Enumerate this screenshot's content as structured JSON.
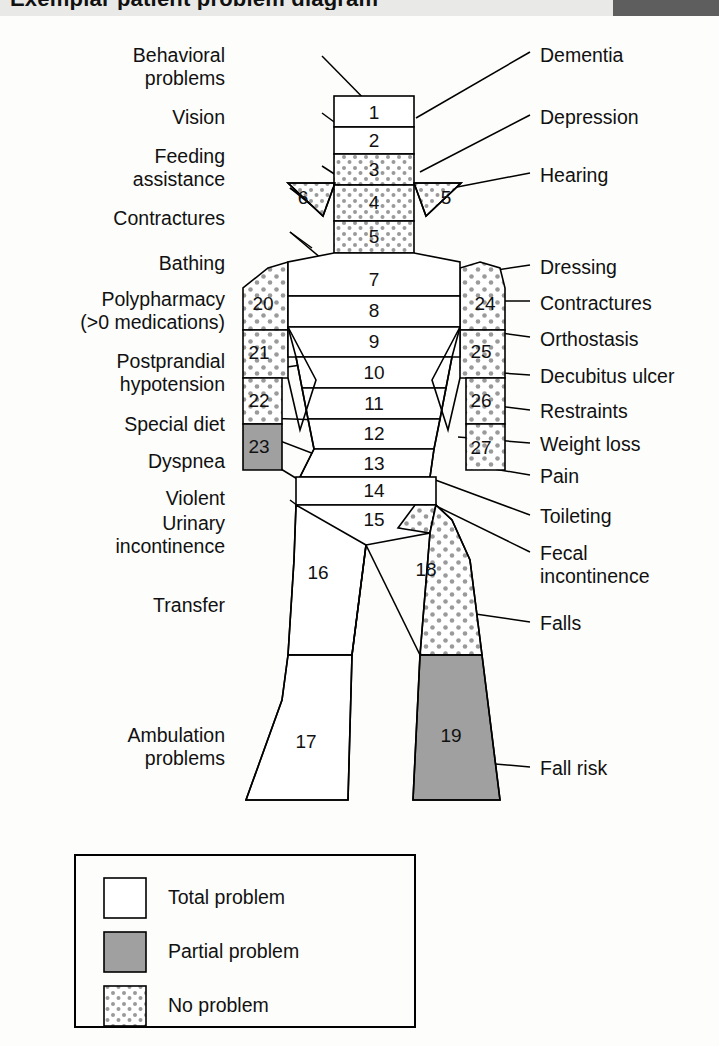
{
  "header": {
    "title_partial": "Exemplar patient problem diagram",
    "accent_dark": "#5e5e5e",
    "band_light": "#e9e9e7"
  },
  "colors": {
    "total_problem": "#ffffff",
    "partial_problem": "#a0a0a0",
    "no_problem_dot": "#9a9a9a",
    "no_problem_bg": "#ffffff",
    "stroke": "#000000",
    "text": "#111111"
  },
  "diagram": {
    "left_labels": [
      {
        "id": "behavioral-problems",
        "lines": [
          "Behavioral",
          "problems"
        ],
        "x": 232,
        "y": 44
      },
      {
        "id": "vision",
        "lines": [
          "Vision"
        ],
        "x": 232,
        "y": 106
      },
      {
        "id": "feeding-assistance",
        "lines": [
          "Feeding",
          "assistance"
        ],
        "x": 232,
        "y": 145
      },
      {
        "id": "contractures-left",
        "lines": [
          "Contractures"
        ],
        "x": 232,
        "y": 207
      },
      {
        "id": "bathing",
        "lines": [
          "Bathing"
        ],
        "x": 232,
        "y": 252
      },
      {
        "id": "polypharmacy",
        "lines": [
          "Polypharmacy",
          "(>0 medications)"
        ],
        "x": 232,
        "y": 288
      },
      {
        "id": "postprandial-hypotension",
        "lines": [
          "Postprandial",
          "hypotension"
        ],
        "x": 232,
        "y": 350
      },
      {
        "id": "special-diet",
        "lines": [
          "Special diet"
        ],
        "x": 232,
        "y": 413
      },
      {
        "id": "dyspnea",
        "lines": [
          "Dyspnea"
        ],
        "x": 232,
        "y": 450
      },
      {
        "id": "violent",
        "lines": [
          "Violent"
        ],
        "x": 232,
        "y": 487
      },
      {
        "id": "urinary-incontinence",
        "lines": [
          "Urinary",
          "incontinence"
        ],
        "x": 232,
        "y": 512
      },
      {
        "id": "transfer",
        "lines": [
          "Transfer"
        ],
        "x": 232,
        "y": 597
      },
      {
        "id": "ambulation-problems",
        "lines": [
          "Ambulation",
          "problems"
        ],
        "x": 232,
        "y": 724
      }
    ],
    "right_labels": [
      {
        "id": "dementia",
        "lines": [
          "Dementia"
        ],
        "x": 540,
        "y": 46
      },
      {
        "id": "depression",
        "lines": [
          "Depression"
        ],
        "x": 540,
        "y": 108
      },
      {
        "id": "hearing",
        "lines": [
          "Hearing"
        ],
        "x": 540,
        "y": 166
      },
      {
        "id": "dressing",
        "lines": [
          "Dressing"
        ],
        "x": 540,
        "y": 258
      },
      {
        "id": "contractures-right",
        "lines": [
          "Contractures"
        ],
        "x": 540,
        "y": 294
      },
      {
        "id": "orthostasis",
        "lines": [
          "Orthostasis"
        ],
        "x": 540,
        "y": 330
      },
      {
        "id": "decubitus-ulcer",
        "lines": [
          "Decubitus ulcer"
        ],
        "x": 540,
        "y": 368
      },
      {
        "id": "restraints",
        "lines": [
          "Restraints"
        ],
        "x": 540,
        "y": 403
      },
      {
        "id": "weight-loss",
        "lines": [
          "Weight loss"
        ],
        "x": 540,
        "y": 436
      },
      {
        "id": "pain",
        "lines": [
          "Pain"
        ],
        "x": 540,
        "y": 468
      },
      {
        "id": "toileting",
        "lines": [
          "Toileting"
        ],
        "x": 540,
        "y": 508
      },
      {
        "id": "fecal-incontinence",
        "lines": [
          "Fecal",
          "incontinence"
        ],
        "x": 540,
        "y": 545
      },
      {
        "id": "falls",
        "lines": [
          "Falls"
        ],
        "x": 540,
        "y": 615
      },
      {
        "id": "fall-risk",
        "lines": [
          "Fall risk"
        ],
        "x": 540,
        "y": 760
      }
    ],
    "segments": [
      {
        "n": "1",
        "region": "head",
        "fill": "total",
        "x": 374,
        "y": 112
      },
      {
        "n": "2",
        "region": "head",
        "fill": "total",
        "x": 374,
        "y": 140
      },
      {
        "n": "3",
        "region": "head",
        "fill": "none",
        "x": 374,
        "y": 169
      },
      {
        "n": "4",
        "region": "head",
        "fill": "none",
        "x": 374,
        "y": 198
      },
      {
        "n": "5",
        "region": "head",
        "fill": "none",
        "x": 374,
        "y": 235
      },
      {
        "n": "6",
        "region": "ear-left",
        "fill": "none",
        "x": 301,
        "y": 196
      },
      {
        "n": "5",
        "region": "ear-right",
        "fill": "none",
        "x": 447,
        "y": 192
      },
      {
        "n": "7",
        "region": "torso",
        "fill": "total",
        "x": 374,
        "y": 280
      },
      {
        "n": "8",
        "region": "torso",
        "fill": "total",
        "x": 374,
        "y": 311
      },
      {
        "n": "9",
        "region": "torso",
        "fill": "total",
        "x": 374,
        "y": 341
      },
      {
        "n": "10",
        "region": "torso",
        "fill": "total",
        "x": 374,
        "y": 373
      },
      {
        "n": "11",
        "region": "torso",
        "fill": "total",
        "x": 374,
        "y": 404
      },
      {
        "n": "12",
        "region": "torso",
        "fill": "total",
        "x": 374,
        "y": 434
      },
      {
        "n": "13",
        "region": "torso",
        "fill": "total",
        "x": 374,
        "y": 464
      },
      {
        "n": "14",
        "region": "pelvis",
        "fill": "total",
        "x": 374,
        "y": 489
      },
      {
        "n": "15",
        "region": "pelvis",
        "fill": "total",
        "x": 374,
        "y": 519
      },
      {
        "n": "16",
        "region": "leg-left-upper",
        "fill": "total",
        "x": 318,
        "y": 572
      },
      {
        "n": "17",
        "region": "leg-left-lower",
        "fill": "total",
        "x": 306,
        "y": 741
      },
      {
        "n": "18",
        "region": "leg-right-upper",
        "fill": "none",
        "x": 426,
        "y": 569
      },
      {
        "n": "19",
        "region": "leg-right-lower",
        "fill": "partial",
        "x": 451,
        "y": 735
      },
      {
        "n": "20",
        "region": "arm-left",
        "fill": "none",
        "x": 263,
        "y": 303
      },
      {
        "n": "21",
        "region": "arm-left",
        "fill": "none",
        "x": 259,
        "y": 352
      },
      {
        "n": "22",
        "region": "arm-left",
        "fill": "none",
        "x": 259,
        "y": 400
      },
      {
        "n": "23",
        "region": "arm-left",
        "fill": "partial",
        "x": 259,
        "y": 446
      },
      {
        "n": "24",
        "region": "arm-right",
        "fill": "none",
        "x": 485,
        "y": 303
      },
      {
        "n": "25",
        "region": "arm-right",
        "fill": "none",
        "x": 481,
        "y": 351
      },
      {
        "n": "26",
        "region": "arm-right",
        "fill": "none",
        "x": 481,
        "y": 400
      },
      {
        "n": "27",
        "region": "arm-right",
        "fill": "none",
        "x": 481,
        "y": 447
      }
    ]
  },
  "legend": {
    "items": [
      {
        "id": "total-problem",
        "label": "Total problem",
        "fill": "total"
      },
      {
        "id": "partial-problem",
        "label": "Partial problem",
        "fill": "partial"
      },
      {
        "id": "no-problem",
        "label": "No problem",
        "fill": "none"
      }
    ],
    "box": {
      "x": 75,
      "y": 855,
      "w": 340,
      "h": 172
    }
  }
}
